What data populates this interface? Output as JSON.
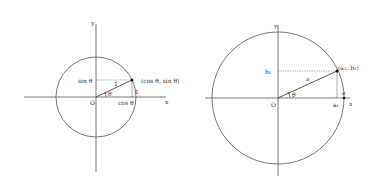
{
  "left_diagram": {
    "center": [
      96,
      97
    ],
    "radius": 40,
    "point": [
      132,
      80
    ],
    "labels": {
      "y_axis": "y",
      "x_axis": "x",
      "origin": "O",
      "sin": "sin θ",
      "cos": "cos θ",
      "point": "(cos θ, sin θ)",
      "radius": "1",
      "arc": "1",
      "angle": "θ"
    }
  },
  "right_diagram": {
    "center": [
      278,
      98
    ],
    "radius": 66,
    "point": [
      337,
      71
    ],
    "labels": {
      "y_axis": "y",
      "x_axis": "x",
      "origin": "O",
      "b": "b₁",
      "a_proj": "a₁",
      "point": "(a₁, b₁)",
      "radius": "a",
      "x_intercept": "a",
      "angle": "θ"
    }
  }
}
